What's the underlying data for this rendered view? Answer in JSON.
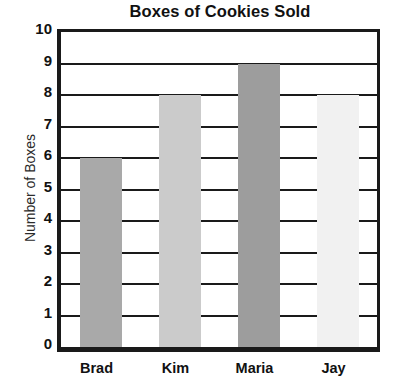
{
  "chart_data": {
    "type": "bar",
    "title": "Boxes of Cookies Sold",
    "xlabel": "",
    "ylabel": "Number of Boxes",
    "categories": [
      "Brad",
      "Kim",
      "Maria",
      "Jay"
    ],
    "values": [
      6,
      8,
      9,
      8
    ],
    "ylim": [
      0,
      10
    ],
    "ytick_labels": [
      "10",
      "9",
      "8",
      "7",
      "6",
      "5",
      "4",
      "3",
      "2",
      "1",
      "0"
    ],
    "ytick_values": [
      10,
      9,
      8,
      7,
      6,
      5,
      4,
      3,
      2,
      1,
      0
    ],
    "grid": true,
    "legend": "none",
    "bar_colors": [
      "#a9a9a9",
      "#cbcbcb",
      "#9d9d9d",
      "#f1f1f1"
    ],
    "axis_color": "#1a1a1a",
    "background_color": "#ffffff"
  }
}
